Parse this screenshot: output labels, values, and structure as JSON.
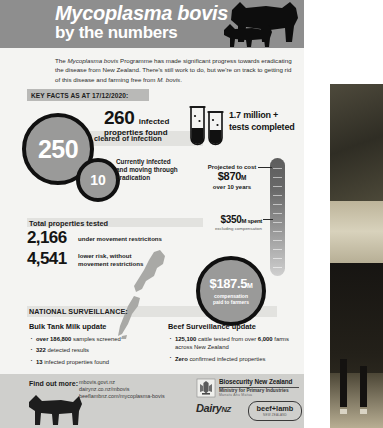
{
  "header": {
    "title": "Mycoplasma bovis",
    "subtitle": "by the numbers",
    "cow_icon": "cow-silhouette-icon",
    "calf_icon": "calf-silhouette-icon"
  },
  "intro": {
    "text_part1": "The ",
    "emphasis1": "Mycoplasma bovis",
    "text_part2": " Programme has made significant progress towards eradicating the disease from New Zealand. There's still work to do, but we're on track to getting rid of this disease and farming free from ",
    "emphasis2": "M. bovis",
    "text_part3": "."
  },
  "key_facts_banner": "KEY FACTS AS AT 17/12/2020:",
  "stats": {
    "infected_found_number": "260",
    "infected_found_label_line1": "infected",
    "infected_found_label_line2": "properties found",
    "cleared_circle_value": "250",
    "cleared_label": "cleared of infection",
    "current_circle_value": "10",
    "current_label_line1": "Currently infected",
    "current_label_line2": "and moving through",
    "current_label_line3": "eradication",
    "tests_line1": "1.7 million +",
    "tests_line2": "tests completed",
    "test_tube_icon": "test-tube-icon"
  },
  "cost": {
    "projected_label": "Projected to cost",
    "projected_amount": "$870",
    "projected_amount_suffix": "M",
    "projected_period": "over 10 years",
    "spent_amount": "$350",
    "spent_amount_suffix": "M",
    "spent_word": " spent",
    "spent_note": "excluding compensation",
    "thermometer_icon": "thermometer-icon"
  },
  "properties_tested": {
    "heading": "Total properties tested",
    "rows": [
      {
        "number": "2,166",
        "label_line1": "under movement restricitons",
        "label_line2": ""
      },
      {
        "number": "4,541",
        "label_line1": "lower risk, without",
        "label_line2": "movement restrictions"
      }
    ]
  },
  "compensation": {
    "amount": "$187.5",
    "amount_suffix": "M",
    "label_line1": "compensation",
    "label_line2": "paid to farmers",
    "map_icon": "new-zealand-map-icon"
  },
  "surveillance": {
    "section_title": "NATIONAL SURVEILLANCE:",
    "bulk_tank_milk": {
      "heading": "Bulk Tank Milk update",
      "items": [
        {
          "bold": "over 186,800",
          "rest": " samples screened"
        },
        {
          "bold": "322",
          "rest": " detected results"
        },
        {
          "bold": "13",
          "rest": " infected properties found"
        }
      ]
    },
    "beef": {
      "heading": "Beef Surveillance update",
      "items": [
        {
          "bold": "125,100",
          "rest": " cattle tested from over"
        },
        {
          "bold": "6,000",
          "rest": " farms across New Zealand"
        },
        {
          "bold": "Zero",
          "rest": " confirmed infected properties"
        }
      ]
    }
  },
  "footer": {
    "find_out_more": "Find out more:",
    "urls": [
      "mbovis.govt.nz",
      "dairynz.co.nz/mbovis",
      "beeflambnz.com/mycoplasma-bovis"
    ],
    "cow_icon": "cow-silhouette-icon",
    "logos": {
      "biosecurity_crest_icon": "nz-government-crest-icon",
      "biosecurity_title": "Biosecurity New Zealand",
      "biosecurity_ministry": "Ministry for Primary Industries",
      "biosecurity_maori": "Manatu Ahu Matua",
      "dairynz_main": "Dairy",
      "dairynz_suffix": "NZ",
      "beef_lamb_name": "beef+lamb",
      "beef_lamb_sub": "NEW ZEALAND"
    }
  },
  "photo": {
    "caption_icon": "cow-in-paddock-photo"
  },
  "colors": {
    "header_band": "#8e8e8e",
    "sheet_bg": "#f4f4f2",
    "band_grey": "#e2e2df",
    "circle_fill": "#9a9a99",
    "circle_ring": "#101010",
    "footer_bg": "#cfcfcc"
  }
}
